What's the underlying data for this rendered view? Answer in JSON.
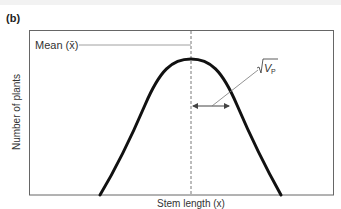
{
  "panel_label": "(b)",
  "diagram": {
    "mean_label": "Mean (x̄)",
    "variance_label_root": "√",
    "variance_label_sym": "V",
    "variance_label_sub": "P",
    "x_axis_label": "Stem length (x)",
    "y_axis_label": "Number of plants",
    "curve": "normal distribution (bell curve)",
    "annotation": "√V_P arrow from mean to inflection point (one standard deviation)"
  },
  "colors": {
    "curve": "#111111",
    "frame": "#666666",
    "dashed_mean_line": "#555555",
    "leader_lines": "#777777"
  }
}
